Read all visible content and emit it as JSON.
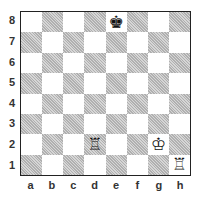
{
  "board": {
    "files": [
      "a",
      "b",
      "c",
      "d",
      "e",
      "f",
      "g",
      "h"
    ],
    "ranks": [
      "8",
      "7",
      "6",
      "5",
      "4",
      "3",
      "2",
      "1"
    ],
    "pieces": [
      {
        "square": "e8",
        "piece": "king",
        "color": "black",
        "glyph": "♚"
      },
      {
        "square": "d2",
        "piece": "rook",
        "color": "white",
        "glyph": "♖"
      },
      {
        "square": "g2",
        "piece": "king",
        "color": "white",
        "glyph": "♔"
      },
      {
        "square": "h1",
        "piece": "rook",
        "color": "white",
        "glyph": "♖"
      }
    ]
  },
  "colors": {
    "light_square": "#ffffff",
    "dark_square": "#c8c8c8",
    "border": "#222222"
  }
}
